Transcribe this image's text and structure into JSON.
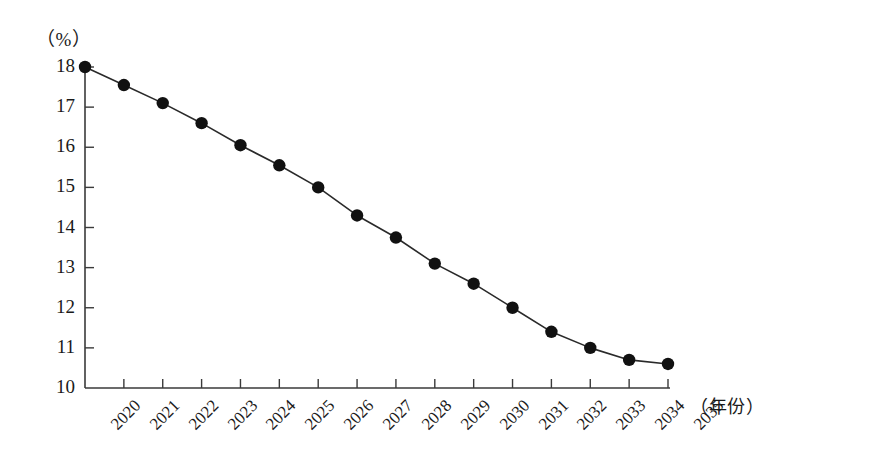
{
  "chart_data": {
    "type": "line",
    "title": "",
    "subtitle": "",
    "xlabel": "（年份）",
    "ylabel": "（%）",
    "categories": [
      "2020",
      "2021",
      "2022",
      "2023",
      "2024",
      "2025",
      "2026",
      "2027",
      "2028",
      "2029",
      "2030",
      "2031",
      "2032",
      "2033",
      "2034",
      "2035"
    ],
    "values": [
      18.0,
      17.55,
      17.1,
      16.6,
      16.05,
      15.55,
      15.0,
      14.3,
      13.75,
      13.1,
      12.6,
      12.0,
      11.4,
      11.0,
      10.7,
      10.6
    ],
    "series": [
      {
        "name": "比率",
        "values": [
          18.0,
          17.55,
          17.1,
          16.6,
          16.05,
          15.55,
          15.0,
          14.3,
          13.75,
          13.1,
          12.6,
          12.0,
          11.4,
          11.0,
          10.7,
          10.6
        ]
      }
    ],
    "ylim": [
      10,
      18
    ],
    "yticks": [
      10,
      11,
      12,
      13,
      14,
      15,
      16,
      17,
      18
    ],
    "ytick_labels": [
      "10",
      "11",
      "12",
      "13",
      "14",
      "15",
      "16",
      "17",
      "18"
    ],
    "xlim": [
      "2020",
      "2035"
    ],
    "grid": false,
    "legend": false,
    "legend_position": "none",
    "marker": "filled-circle",
    "marker_color": "#111111",
    "line_color": "#2a2a2a",
    "axis_color": "#3a3a3a",
    "background_color": "#ffffff",
    "xtick_rotation": -45
  },
  "axes": {
    "y_unit_text": "（%）",
    "x_unit_text": "（年份）"
  }
}
